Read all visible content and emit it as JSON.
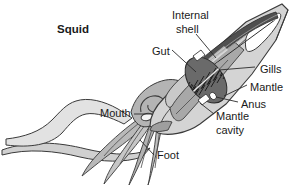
{
  "figure": {
    "title": "Squid",
    "type": "anatomical-diagram",
    "background_color": "#ffffff",
    "line_color": "#3a3a3a",
    "text_color": "#1a1a1a",
    "fills": {
      "mantle_light": "#d8d8d8",
      "mantle_mid": "#bdbdbd",
      "body_dark": "#9a9a9a",
      "shell_dark": "#4a4a4a",
      "gill_dark": "#565656",
      "white": "#ffffff"
    }
  },
  "labels": [
    {
      "id": "title",
      "text": "Squid",
      "x": 57,
      "y": 30
    },
    {
      "id": "internal-shell",
      "text": "Internal",
      "x": 172,
      "y": 16
    },
    {
      "id": "internal-shell-2",
      "text": "shell",
      "x": 176,
      "y": 30
    },
    {
      "id": "gut",
      "text": "Gut",
      "x": 152,
      "y": 52
    },
    {
      "id": "gills",
      "text": "Gills",
      "x": 257,
      "y": 70
    },
    {
      "id": "mantle",
      "text": "Mantle",
      "x": 249,
      "y": 88
    },
    {
      "id": "anus",
      "text": "Anus",
      "x": 240,
      "y": 105
    },
    {
      "id": "mantle-cavity",
      "text": "Mantle",
      "x": 215,
      "y": 117
    },
    {
      "id": "mantle-cavity-2",
      "text": "cavity",
      "x": 215,
      "y": 130
    },
    {
      "id": "mouth",
      "text": "Mouth",
      "x": 104,
      "y": 117
    },
    {
      "id": "foot",
      "text": "Foot",
      "x": 156,
      "y": 158
    }
  ],
  "parts": [
    "internal shell",
    "gut",
    "gills",
    "mantle",
    "anus",
    "mantle cavity",
    "mouth",
    "foot"
  ]
}
